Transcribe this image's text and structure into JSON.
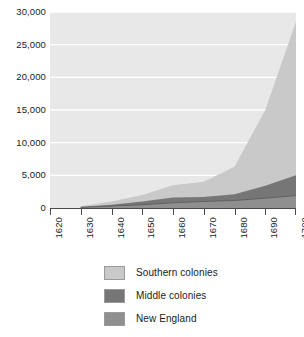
{
  "chart_data": {
    "type": "area",
    "stacked": true,
    "title": "",
    "subtitle": "",
    "xlabel": "",
    "ylabel": "",
    "x": [
      1630,
      1640,
      1650,
      1660,
      1670,
      1680,
      1690,
      1700
    ],
    "xlim": [
      1620,
      1700
    ],
    "ylim": [
      0,
      30000
    ],
    "xticks": [
      1620,
      1630,
      1640,
      1650,
      1660,
      1670,
      1680,
      1690,
      1700
    ],
    "xtick_labels": [
      "1620",
      "1630",
      "1640",
      "1650",
      "1660",
      "1670",
      "1680",
      "1690",
      "1700"
    ],
    "yticks": [
      0,
      5000,
      10000,
      15000,
      20000,
      25000,
      30000
    ],
    "ytick_labels": [
      "0",
      "5,000",
      "10,000",
      "15,000",
      "20,000",
      "25,000",
      "30,000"
    ],
    "grid": "horizontal",
    "legend_position": "below",
    "stack_order_bottom_to_top": [
      "New England",
      "Middle colonies",
      "Southern colonies"
    ],
    "series": [
      {
        "name": "New England",
        "color": "#8f8f8f",
        "values": [
          100,
          300,
          500,
          800,
          1000,
          1150,
          1500,
          1900
        ]
      },
      {
        "name": "Middle colonies",
        "color": "#767676",
        "values": [
          50,
          200,
          500,
          800,
          700,
          950,
          1900,
          3100
        ]
      },
      {
        "name": "Southern colonies",
        "color": "#c9c9c9",
        "values": [
          100,
          500,
          1000,
          1900,
          2300,
          4200,
          11600,
          23500
        ]
      }
    ],
    "cumulative_totals": [
      250,
      1000,
      2000,
      3500,
      4000,
      6300,
      15000,
      28500
    ]
  },
  "axes": {
    "y_axis_name": "population-axis",
    "x_axis_name": "year-axis"
  },
  "legend": {
    "items": [
      {
        "label": "Southern colonies",
        "color": "#c9c9c9"
      },
      {
        "label": "Middle colonies",
        "color": "#767676"
      },
      {
        "label": "New England",
        "color": "#8f8f8f"
      }
    ]
  },
  "colors": {
    "plot_background": "#e8e8e8",
    "gridline": "#ffffff",
    "axis_line": "#4a4a4a",
    "page_background": "#ffffff",
    "text": "#1a1a1a",
    "swatch_border": "#9a9a9a"
  }
}
